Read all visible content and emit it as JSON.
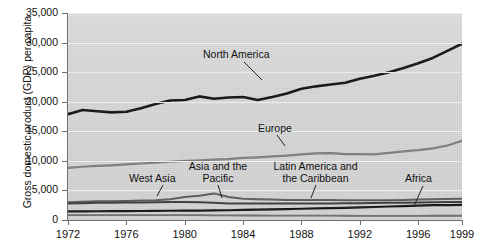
{
  "chart_data": {
    "type": "line",
    "title": "",
    "xlabel": "",
    "ylabel": "Gross domestic product (GDP) per capita",
    "xlim": [
      1972,
      1999
    ],
    "ylim": [
      0,
      35000
    ],
    "grid": true,
    "legend_position": "inline-labels",
    "x": [
      1972,
      1973,
      1974,
      1975,
      1976,
      1977,
      1978,
      1979,
      1980,
      1981,
      1982,
      1983,
      1984,
      1985,
      1986,
      1987,
      1988,
      1989,
      1990,
      1991,
      1992,
      1993,
      1994,
      1995,
      1996,
      1997,
      1998,
      1999
    ],
    "xticks": [
      "1972",
      "1976",
      "1980",
      "1984",
      "1988",
      "1992",
      "1996",
      "1999"
    ],
    "yticks": [
      "0",
      "5,000",
      "10,000",
      "15,000",
      "20,000",
      "25,000",
      "30,000",
      "35,000"
    ],
    "series": [
      {
        "name": "North America",
        "color": "#111111",
        "width": 2.6,
        "values": [
          17900,
          18600,
          18400,
          18200,
          18300,
          18900,
          19600,
          20200,
          20300,
          20900,
          20500,
          20700,
          20800,
          20300,
          20800,
          21400,
          22200,
          22600,
          22900,
          23200,
          23900,
          24400,
          25000,
          25700,
          26500,
          27400,
          28600,
          29800
        ]
      },
      {
        "name": "Europe",
        "color": "#7d7d7d",
        "width": 2.2,
        "values": [
          8800,
          9000,
          9150,
          9250,
          9400,
          9550,
          9700,
          9850,
          10000,
          10100,
          10200,
          10300,
          10500,
          10600,
          10750,
          10900,
          11100,
          11250,
          11300,
          11150,
          11150,
          11100,
          11350,
          11600,
          11800,
          12100,
          12600,
          13400
        ]
      },
      {
        "name": "West Asia",
        "color": "#5a5a5a",
        "width": 2.0,
        "values": [
          3000,
          3100,
          3150,
          3150,
          3200,
          3300,
          3350,
          3500,
          3900,
          4100,
          4500,
          3900,
          3600,
          3500,
          3450,
          3400,
          3400,
          3400,
          3400,
          3350,
          3350,
          3350,
          3350,
          3400,
          3450,
          3500,
          3550,
          3600
        ]
      },
      {
        "name": "Latin America and the Caribbean",
        "color": "#3a3a3a",
        "width": 2.0,
        "values": [
          2800,
          2850,
          2900,
          2900,
          2950,
          2950,
          3000,
          3050,
          3050,
          3000,
          2900,
          2800,
          2800,
          2800,
          2800,
          2800,
          2800,
          2800,
          2800,
          2820,
          2850,
          2870,
          2900,
          2900,
          2950,
          3000,
          3050,
          3050
        ]
      },
      {
        "name": "Asia and the Pacific",
        "color": "#111111",
        "width": 2.2,
        "values": [
          1450,
          1470,
          1480,
          1490,
          1500,
          1520,
          1540,
          1560,
          1580,
          1600,
          1620,
          1650,
          1700,
          1750,
          1800,
          1850,
          1900,
          1950,
          2000,
          2050,
          2120,
          2200,
          2280,
          2350,
          2430,
          2500,
          2520,
          2550
        ]
      },
      {
        "name": "Africa",
        "color": "#6a6a6a",
        "width": 1.8,
        "values": [
          820,
          830,
          840,
          830,
          830,
          830,
          830,
          830,
          820,
          810,
          790,
          770,
          760,
          760,
          750,
          740,
          740,
          740,
          730,
          720,
          710,
          700,
          700,
          700,
          710,
          720,
          720,
          720
        ]
      }
    ],
    "annotations": [
      {
        "label": "North America",
        "x_px": 246,
        "y_px": 54
      },
      {
        "label": "Europe",
        "x_px": 277,
        "y_px": 128
      },
      {
        "label": "West Asia",
        "x_px": 161,
        "y_px": 178
      },
      {
        "label": "Asia and the\nPacific",
        "line1": "Asia and the",
        "line2": "Pacific",
        "x_px": 216,
        "y_px": 172
      },
      {
        "label": "Latin America and\nthe Caribbean",
        "line1": "Latin America and",
        "line2": "the Caribbean",
        "x_px": 315,
        "y_px": 172
      },
      {
        "label": "Africa",
        "x_px": 421,
        "y_px": 178
      }
    ]
  },
  "axis": {
    "ytitle": "Gross domestic product (GDP) per capita",
    "yticks": [
      {
        "label": "35,000",
        "value": 35000
      },
      {
        "label": "30,000",
        "value": 30000
      },
      {
        "label": "25,000",
        "value": 25000
      },
      {
        "label": "20,000",
        "value": 20000
      },
      {
        "label": "15,000",
        "value": 15000
      },
      {
        "label": "10,000",
        "value": 10000
      },
      {
        "label": "5,000",
        "value": 5000
      },
      {
        "label": "0",
        "value": 0
      }
    ],
    "xticks": [
      {
        "label": "1972",
        "value": 1972
      },
      {
        "label": "1976",
        "value": 1976
      },
      {
        "label": "1980",
        "value": 1980
      },
      {
        "label": "1984",
        "value": 1984
      },
      {
        "label": "1988",
        "value": 1988
      },
      {
        "label": "1992",
        "value": 1992
      },
      {
        "label": "1996",
        "value": 1996
      },
      {
        "label": "1999",
        "value": 1999
      }
    ]
  },
  "labels": {
    "north_america": "North America",
    "europe": "Europe",
    "west_asia": "West Asia",
    "asia_pacific_1": "Asia and the",
    "asia_pacific_2": "Pacific",
    "latin_america_1": "Latin America and",
    "latin_america_2": "the Caribbean",
    "africa": "Africa"
  },
  "colors": {
    "plot_background": "#d8d8d8",
    "gridline": "#f3f3f3",
    "axis": "#6e6e6e",
    "north_america": "#111111",
    "europe": "#7d7d7d",
    "text": "#111111"
  }
}
